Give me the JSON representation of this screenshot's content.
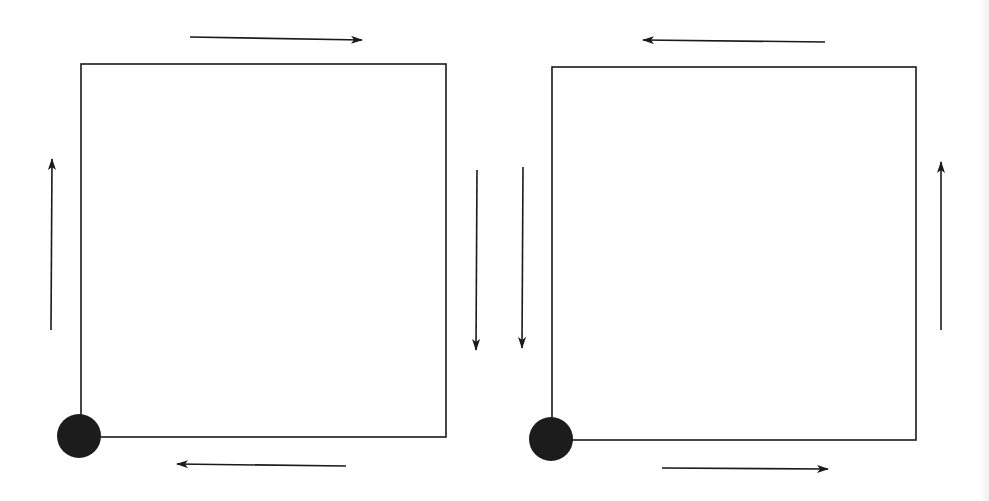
{
  "diagram": {
    "type": "circulation-direction-comparison",
    "stroke_color": "#1a1a1a",
    "dot_color": "#1c1c1c",
    "panels": [
      {
        "id": "left",
        "direction": "clockwise",
        "square": {
          "x1": 81,
          "y1": 64,
          "x2": 446,
          "y2": 437
        },
        "start_dot": {
          "cx": 79,
          "cy": 436,
          "r": 22,
          "corner": "bottom-left"
        },
        "arrows": [
          {
            "side": "top",
            "points": "right",
            "x1": 190,
            "y1": 37,
            "x2": 362,
            "y2": 40
          },
          {
            "side": "right",
            "points": "down",
            "x1": 477,
            "y1": 170,
            "x2": 476,
            "y2": 350
          },
          {
            "side": "bottom",
            "points": "left",
            "x1": 346,
            "y1": 466,
            "x2": 177,
            "y2": 464
          },
          {
            "side": "left",
            "points": "up",
            "x1": 51,
            "y1": 330,
            "x2": 52,
            "y2": 159
          }
        ]
      },
      {
        "id": "right",
        "direction": "counter-clockwise",
        "square": {
          "x1": 552,
          "y1": 67,
          "x2": 916,
          "y2": 440
        },
        "start_dot": {
          "cx": 551,
          "cy": 439,
          "r": 22,
          "corner": "bottom-left"
        },
        "arrows": [
          {
            "side": "top",
            "points": "left",
            "x1": 825,
            "y1": 42,
            "x2": 643,
            "y2": 40
          },
          {
            "side": "left",
            "points": "down",
            "x1": 523,
            "y1": 167,
            "x2": 522,
            "y2": 348
          },
          {
            "side": "bottom",
            "points": "right",
            "x1": 662,
            "y1": 468,
            "x2": 828,
            "y2": 469
          },
          {
            "side": "right",
            "points": "up",
            "x1": 941,
            "y1": 330,
            "x2": 941,
            "y2": 162
          }
        ]
      }
    ]
  }
}
